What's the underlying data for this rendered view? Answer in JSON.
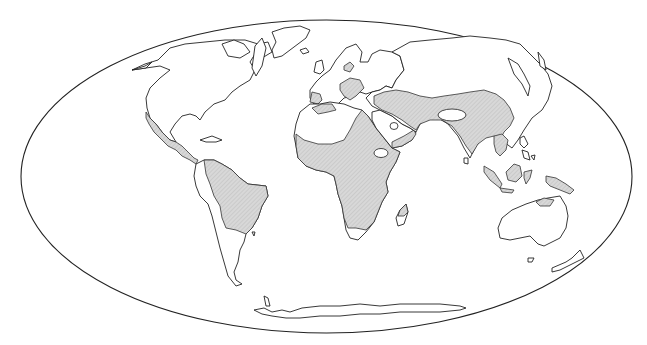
{
  "map": {
    "projection": "elliptical (Mollweide-like) world map",
    "colors": {
      "background": "#ffffff",
      "outline": "#222222",
      "shaded_fill": "#d4d4d4",
      "hatch_line": "#b8b8b8"
    },
    "frame": {
      "cx": 326.5,
      "cy": 176.5,
      "rx": 305.5,
      "ry": 156.5
    },
    "shaded_regions": [
      "Mexico and Central America",
      "Northern and central South America (Amazon/Brazil)",
      "Iberia / southern Spain",
      "Northwest Africa coast (Morocco)",
      "Sub-Saharan Africa (excluding southern tip)",
      "Northern Madagascar",
      "Balkans and Black Sea region",
      "Middle East / Arabian Peninsula edges",
      "Central and South Asia (Iran to China)",
      "India",
      "Southeast Asia / Indochina",
      "Borneo, Sumatra, Sulawesi",
      "New Guinea",
      "Northern Australia (Top End)"
    ],
    "unshaded_holes": [
      "Sahara Desert",
      "Central Arabian desert",
      "Ethiopian highlands",
      "Tarim Basin / Taklamakan",
      "Southern Africa tip"
    ]
  }
}
